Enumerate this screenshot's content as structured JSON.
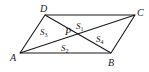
{
  "figure": {
    "type": "parallelogram-with-diagonal-segments",
    "stroke_color": "#1a1a1a",
    "vertices": {
      "A": {
        "label": "A",
        "x": 20,
        "y": 53
      },
      "B": {
        "label": "B",
        "x": 111,
        "y": 53
      },
      "C": {
        "label": "C",
        "x": 135,
        "y": 15
      },
      "D": {
        "label": "D",
        "x": 45,
        "y": 15
      },
      "P": {
        "label": "P",
        "x": 64,
        "y": 40
      }
    },
    "regions": [
      {
        "id": "S1",
        "letter": "S",
        "sub": "1"
      },
      {
        "id": "S2",
        "letter": "S",
        "sub": "2"
      },
      {
        "id": "S3",
        "letter": "S",
        "sub": "3"
      },
      {
        "id": "S4",
        "letter": "S",
        "sub": "4"
      }
    ]
  }
}
